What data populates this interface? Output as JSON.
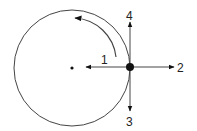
{
  "diagram": {
    "colors": {
      "stroke": "#444444",
      "ink": "#111111",
      "background": "#ffffff"
    },
    "circle": {
      "cx": 72,
      "cy": 68,
      "r": 58
    },
    "center_dot": {
      "cx": 72,
      "cy": 68
    },
    "object_dot": {
      "cx": 130,
      "cy": 67
    },
    "rotation": "counterclockwise",
    "arrows": [
      {
        "id": "1",
        "label": "1",
        "direction": "toward-center"
      },
      {
        "id": "2",
        "label": "2",
        "direction": "outward-right"
      },
      {
        "id": "3",
        "label": "3",
        "direction": "down"
      },
      {
        "id": "4",
        "label": "4",
        "direction": "up"
      }
    ]
  }
}
